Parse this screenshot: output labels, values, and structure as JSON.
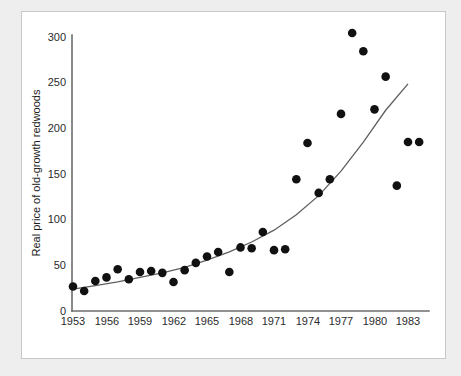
{
  "figure": {
    "background_color": "#eeeeee",
    "card_color": "#ffffff",
    "border_color": "#c8c8c8"
  },
  "chart_data": {
    "type": "scatter",
    "title": "",
    "subtitle": "",
    "xlabel": "",
    "ylabel": "Real price of old-growth redwoods",
    "xlim": [
      1952.2,
      1985.0
    ],
    "ylim": [
      0,
      318
    ],
    "xticks": [
      1953,
      1956,
      1959,
      1962,
      1965,
      1968,
      1971,
      1974,
      1977,
      1980,
      1983
    ],
    "yticks": [
      0,
      50,
      100,
      150,
      200,
      250,
      300
    ],
    "xtick_labels": [
      "1953",
      "1956",
      "1959",
      "1962",
      "1965",
      "1968",
      "1971",
      "1974",
      "1977",
      "1980",
      "1983"
    ],
    "ytick_labels": [
      "0",
      "50",
      "100",
      "150",
      "200",
      "250",
      "300"
    ],
    "grid": false,
    "legend": false,
    "legend_position": "none",
    "marker": {
      "shape": "circle",
      "color": "#111111",
      "size_px": 4.3
    },
    "x": [
      1953,
      1954,
      1955,
      1956,
      1957,
      1958,
      1959,
      1960,
      1961,
      1962,
      1963,
      1964,
      1965,
      1966,
      1967,
      1968,
      1969,
      1970,
      1971,
      1972,
      1973,
      1974,
      1975,
      1976,
      1977,
      1978,
      1979,
      1980,
      1981,
      1982,
      1983,
      1984
    ],
    "y": [
      27,
      22,
      33,
      37,
      46,
      35,
      43,
      44,
      42,
      32,
      45,
      53,
      60,
      65,
      43,
      70,
      69,
      87,
      67,
      68,
      145,
      185,
      130,
      145,
      217,
      306,
      286,
      222,
      258,
      138,
      186,
      186
    ],
    "series": [
      {
        "name": "Real price of old-growth redwoods",
        "x": [
          1953,
          1954,
          1955,
          1956,
          1957,
          1958,
          1959,
          1960,
          1961,
          1962,
          1963,
          1964,
          1965,
          1966,
          1967,
          1968,
          1969,
          1970,
          1971,
          1972,
          1973,
          1974,
          1975,
          1976,
          1977,
          1978,
          1979,
          1980,
          1981,
          1982,
          1983,
          1984
        ],
        "values": [
          27,
          22,
          33,
          37,
          46,
          35,
          43,
          44,
          42,
          32,
          45,
          53,
          60,
          65,
          43,
          70,
          69,
          87,
          67,
          68,
          145,
          185,
          130,
          145,
          217,
          306,
          286,
          222,
          258,
          138,
          186,
          186
        ]
      }
    ],
    "fit": {
      "name": "exponential-trend",
      "type": "exponential",
      "color": "#5f5f5f",
      "x": [
        1953,
        1955,
        1957,
        1959,
        1961,
        1963,
        1965,
        1967,
        1969,
        1971,
        1973,
        1975,
        1977,
        1979,
        1981,
        1983
      ],
      "y": [
        24,
        28,
        32,
        37,
        42,
        48,
        56,
        65,
        76,
        89,
        106,
        127,
        154,
        186,
        221,
        250
      ]
    }
  }
}
